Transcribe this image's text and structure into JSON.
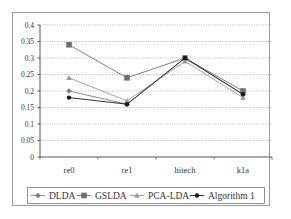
{
  "chart_data": {
    "type": "line",
    "title": "",
    "xlabel": "",
    "ylabel": "",
    "categories": [
      "re0",
      "re1",
      "hitech",
      "k1a"
    ],
    "ylim": [
      0,
      0.4
    ],
    "yticks": [
      "0",
      "0.05",
      "0.1",
      "0.15",
      "0.2",
      "0.25",
      "0.3",
      "0.35",
      "0.4"
    ],
    "grid": true,
    "legend_position": "bottom",
    "series": [
      {
        "name": "DLDA",
        "marker": "diamond",
        "color": "#808080",
        "values": [
          0.2,
          0.16,
          0.3,
          0.19
        ]
      },
      {
        "name": "GSLDA",
        "marker": "square",
        "color": "#707070",
        "values": [
          0.34,
          0.24,
          0.3,
          0.2
        ]
      },
      {
        "name": "PCA-LDA",
        "marker": "triangle",
        "color": "#999999",
        "values": [
          0.24,
          0.17,
          0.29,
          0.18
        ]
      },
      {
        "name": "Algorithm 1",
        "marker": "circle",
        "color": "#1a1a1a",
        "values": [
          0.18,
          0.16,
          0.3,
          0.19
        ]
      }
    ]
  }
}
